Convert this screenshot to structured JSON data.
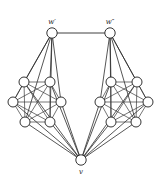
{
  "figure": {
    "background_color": "#ffffff",
    "stroke_color": "#2b2b2b",
    "node_fill": "#ffffff",
    "node_stroke": "#1e1e1e",
    "width": 161,
    "height": 187
  },
  "labels": {
    "apex_left": "w′",
    "apex_right": "w″",
    "bottom": "v"
  },
  "chart_data": {
    "type": "diagram",
    "graph_kind": "undirected",
    "nodes": [
      {
        "id": "wp",
        "label": "w′",
        "label_pos": "above",
        "x": 52,
        "y": 33,
        "r": 5.2,
        "group": "apex"
      },
      {
        "id": "wpp",
        "label": "w″",
        "label_pos": "above",
        "x": 110,
        "y": 33,
        "r": 5.2,
        "group": "apex"
      },
      {
        "id": "v",
        "label": "v",
        "label_pos": "below",
        "x": 81,
        "y": 160,
        "r": 5.2,
        "group": "bottom"
      },
      {
        "id": "L1",
        "label": "",
        "x": 24,
        "y": 82,
        "r": 5.0,
        "group": "left-clique"
      },
      {
        "id": "L2",
        "label": "",
        "x": 50,
        "y": 82,
        "r": 5.0,
        "group": "left-clique"
      },
      {
        "id": "L3",
        "label": "",
        "x": 13,
        "y": 102,
        "r": 5.0,
        "group": "left-clique"
      },
      {
        "id": "L4",
        "label": "",
        "x": 61,
        "y": 102,
        "r": 5.0,
        "group": "left-clique"
      },
      {
        "id": "L5",
        "label": "",
        "x": 25,
        "y": 122,
        "r": 5.0,
        "group": "left-clique"
      },
      {
        "id": "L6",
        "label": "",
        "x": 50,
        "y": 122,
        "r": 5.0,
        "group": "left-clique"
      },
      {
        "id": "R1",
        "label": "",
        "x": 111,
        "y": 82,
        "r": 5.0,
        "group": "right-clique"
      },
      {
        "id": "R2",
        "label": "",
        "x": 137,
        "y": 82,
        "r": 5.0,
        "group": "right-clique"
      },
      {
        "id": "R3",
        "label": "",
        "x": 100,
        "y": 102,
        "r": 5.0,
        "group": "right-clique"
      },
      {
        "id": "R4",
        "label": "",
        "x": 148,
        "y": 102,
        "r": 5.0,
        "group": "right-clique"
      },
      {
        "id": "R5",
        "label": "",
        "x": 111,
        "y": 122,
        "r": 5.0,
        "group": "right-clique"
      },
      {
        "id": "R6",
        "label": "",
        "x": 136,
        "y": 122,
        "r": 5.0,
        "group": "right-clique"
      }
    ],
    "edges": [
      {
        "from": "wp",
        "to": "wpp",
        "kind": "top"
      },
      {
        "from": "wp",
        "to": "L1",
        "kind": "spoke"
      },
      {
        "from": "wp",
        "to": "L2",
        "kind": "spoke"
      },
      {
        "from": "wp",
        "to": "L3",
        "kind": "spoke"
      },
      {
        "from": "wp",
        "to": "L4",
        "kind": "spoke"
      },
      {
        "from": "wp",
        "to": "L5",
        "kind": "spoke"
      },
      {
        "from": "wp",
        "to": "L6",
        "kind": "spoke"
      },
      {
        "from": "wpp",
        "to": "R1",
        "kind": "spoke"
      },
      {
        "from": "wpp",
        "to": "R2",
        "kind": "spoke"
      },
      {
        "from": "wpp",
        "to": "R3",
        "kind": "spoke"
      },
      {
        "from": "wpp",
        "to": "R4",
        "kind": "spoke"
      },
      {
        "from": "wpp",
        "to": "R5",
        "kind": "spoke"
      },
      {
        "from": "wpp",
        "to": "R6",
        "kind": "spoke"
      },
      {
        "from": "v",
        "to": "L1",
        "kind": "spoke"
      },
      {
        "from": "v",
        "to": "L2",
        "kind": "spoke"
      },
      {
        "from": "v",
        "to": "L3",
        "kind": "spoke"
      },
      {
        "from": "v",
        "to": "L4",
        "kind": "spoke"
      },
      {
        "from": "v",
        "to": "L5",
        "kind": "spoke"
      },
      {
        "from": "v",
        "to": "L6",
        "kind": "spoke"
      },
      {
        "from": "v",
        "to": "R1",
        "kind": "spoke"
      },
      {
        "from": "v",
        "to": "R2",
        "kind": "spoke"
      },
      {
        "from": "v",
        "to": "R3",
        "kind": "spoke"
      },
      {
        "from": "v",
        "to": "R4",
        "kind": "spoke"
      },
      {
        "from": "v",
        "to": "R5",
        "kind": "spoke"
      },
      {
        "from": "v",
        "to": "R6",
        "kind": "spoke"
      },
      {
        "from": "L1",
        "to": "L2",
        "kind": "clique"
      },
      {
        "from": "L1",
        "to": "L3",
        "kind": "clique"
      },
      {
        "from": "L1",
        "to": "L4",
        "kind": "clique"
      },
      {
        "from": "L1",
        "to": "L5",
        "kind": "clique"
      },
      {
        "from": "L1",
        "to": "L6",
        "kind": "clique"
      },
      {
        "from": "L2",
        "to": "L3",
        "kind": "clique"
      },
      {
        "from": "L2",
        "to": "L4",
        "kind": "clique"
      },
      {
        "from": "L2",
        "to": "L5",
        "kind": "clique"
      },
      {
        "from": "L2",
        "to": "L6",
        "kind": "clique"
      },
      {
        "from": "L3",
        "to": "L4",
        "kind": "clique"
      },
      {
        "from": "L3",
        "to": "L5",
        "kind": "clique"
      },
      {
        "from": "L3",
        "to": "L6",
        "kind": "clique"
      },
      {
        "from": "L4",
        "to": "L5",
        "kind": "clique"
      },
      {
        "from": "L4",
        "to": "L6",
        "kind": "clique"
      },
      {
        "from": "L5",
        "to": "L6",
        "kind": "clique"
      },
      {
        "from": "R1",
        "to": "R2",
        "kind": "clique"
      },
      {
        "from": "R1",
        "to": "R3",
        "kind": "clique"
      },
      {
        "from": "R1",
        "to": "R4",
        "kind": "clique"
      },
      {
        "from": "R1",
        "to": "R5",
        "kind": "clique"
      },
      {
        "from": "R1",
        "to": "R6",
        "kind": "clique"
      },
      {
        "from": "R2",
        "to": "R3",
        "kind": "clique"
      },
      {
        "from": "R2",
        "to": "R4",
        "kind": "clique"
      },
      {
        "from": "R2",
        "to": "R5",
        "kind": "clique"
      },
      {
        "from": "R2",
        "to": "R6",
        "kind": "clique"
      },
      {
        "from": "R3",
        "to": "R4",
        "kind": "clique"
      },
      {
        "from": "R3",
        "to": "R5",
        "kind": "clique"
      },
      {
        "from": "R3",
        "to": "R6",
        "kind": "clique"
      },
      {
        "from": "R4",
        "to": "R5",
        "kind": "clique"
      },
      {
        "from": "R4",
        "to": "R6",
        "kind": "clique"
      },
      {
        "from": "R5",
        "to": "R6",
        "kind": "clique"
      }
    ]
  }
}
